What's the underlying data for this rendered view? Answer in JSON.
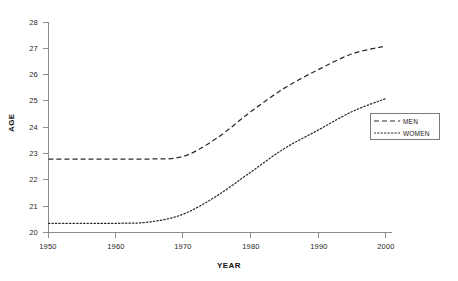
{
  "chart_data": {
    "type": "line",
    "title": "",
    "xlabel": "YEAR",
    "ylabel": "AGE",
    "xlim": [
      1950,
      2000
    ],
    "ylim": [
      20,
      28
    ],
    "xticks": [
      1950,
      1960,
      1970,
      1980,
      1990,
      2000
    ],
    "yticks": [
      20,
      21,
      22,
      23,
      24,
      25,
      26,
      27,
      28
    ],
    "grid": false,
    "legend_position": "right-middle",
    "x": [
      1950,
      1955,
      1960,
      1965,
      1970,
      1975,
      1980,
      1985,
      1990,
      1995,
      2000
    ],
    "series": [
      {
        "name": "MEN",
        "style": "dashed",
        "color": "#2b2b2b",
        "values": [
          22.8,
          22.8,
          22.8,
          22.8,
          22.9,
          23.6,
          24.6,
          25.5,
          26.2,
          26.8,
          27.1
        ]
      },
      {
        "name": "WOMEN",
        "style": "dotted",
        "color": "#2b2b2b",
        "values": [
          20.35,
          20.35,
          20.35,
          20.4,
          20.7,
          21.4,
          22.3,
          23.2,
          23.9,
          24.6,
          25.1
        ]
      }
    ]
  },
  "axes": {
    "y_title": "AGE",
    "x_title": "YEAR",
    "y_tick_labels": [
      "28",
      "27",
      "26",
      "25",
      "24",
      "23",
      "22",
      "21",
      "20"
    ],
    "x_tick_labels": [
      "1950",
      "1960",
      "1970",
      "1980",
      "1990",
      "2000"
    ]
  },
  "legend": {
    "entries": [
      {
        "label": "MEN",
        "style": "dashed"
      },
      {
        "label": "WOMEN",
        "style": "dotted"
      }
    ]
  },
  "caption": {
    "text": ""
  }
}
